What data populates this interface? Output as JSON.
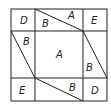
{
  "diagram": {
    "stroke_color": "#222222",
    "background": "#ffffff",
    "labels": [
      {
        "id": "top-left",
        "text": "D",
        "x": 20,
        "y": 24
      },
      {
        "id": "top-mid-b",
        "text": "B",
        "x": 42,
        "y": 27
      },
      {
        "id": "top-mid-a",
        "text": "A",
        "x": 68,
        "y": 17
      },
      {
        "id": "top-right",
        "text": "E",
        "x": 91,
        "y": 23
      },
      {
        "id": "left-b",
        "text": "B",
        "x": 23,
        "y": 43
      },
      {
        "id": "center-a",
        "text": "A",
        "x": 56,
        "y": 58
      },
      {
        "id": "right-b",
        "text": "B",
        "x": 87,
        "y": 71
      },
      {
        "id": "bottom-left",
        "text": "E",
        "x": 19,
        "y": 94
      },
      {
        "id": "bottom-mid-b",
        "text": "B",
        "x": 69,
        "y": 91
      },
      {
        "id": "bottom-right",
        "text": "D",
        "x": 91,
        "y": 94
      }
    ]
  }
}
